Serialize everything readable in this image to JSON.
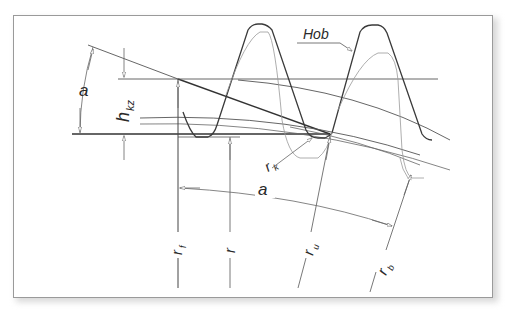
{
  "diagram": {
    "labels": {
      "hob": "Hob",
      "angle_a_left": "a",
      "angle_a_bottom": "a",
      "h_kz_main": "h",
      "h_kz_sub": "kz",
      "r_k": "r",
      "r_k_sub": "k",
      "r_f": "r",
      "r_f_sub": "f",
      "r": "r",
      "r_u": "r",
      "r_u_sub": "u",
      "r_b": "r",
      "r_b_sub": "b"
    },
    "colors": {
      "line_dark": "#3a3a3a",
      "line_light": "#8a8a8a",
      "frame": "#9a9a9a",
      "background": "#ffffff"
    }
  }
}
